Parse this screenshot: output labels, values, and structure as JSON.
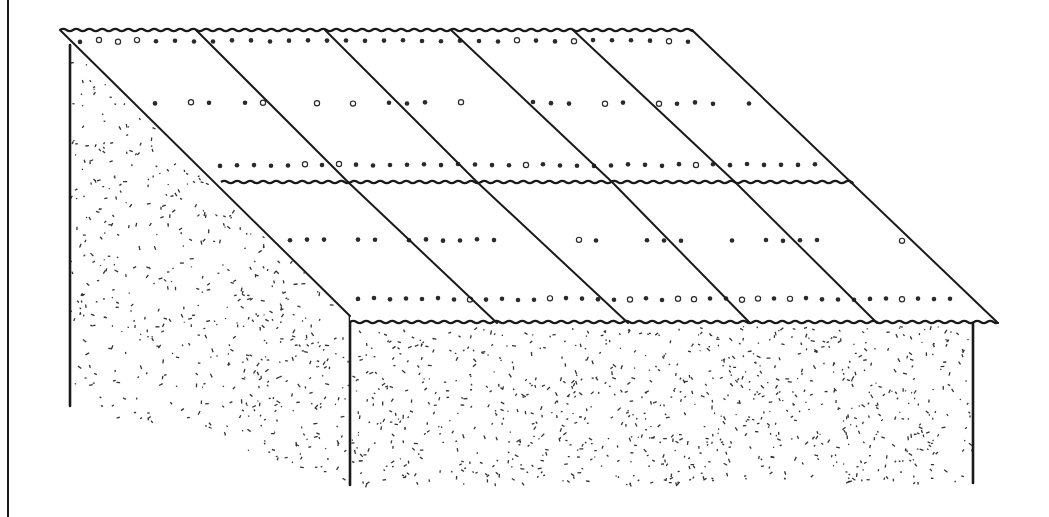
{
  "figure": {
    "colors": {
      "line": "#1a1a1a",
      "background": "#ffffff",
      "stipple": "#333333"
    },
    "frame_line": {
      "x": 8,
      "y1": 0,
      "y2": 517
    },
    "roof": {
      "ridge": {
        "x1": 60,
        "x2": 692,
        "y": 30
      },
      "left_edge": {
        "x1": 60,
        "y1": 30,
        "x2": 350,
        "y2": 316
      },
      "right_edge": {
        "x1": 692,
        "y1": 30,
        "x2": 998,
        "y2": 323
      },
      "mid_seam": {
        "x1": 221,
        "x2": 850,
        "y": 182
      },
      "eave": {
        "x1": 350,
        "x2": 998,
        "y": 322
      },
      "upper_dividers": [
        {
          "x1": 196,
          "y1": 30,
          "x2": 348,
          "y2": 182
        },
        {
          "x1": 325,
          "y1": 30,
          "x2": 477,
          "y2": 182
        },
        {
          "x1": 451,
          "y1": 30,
          "x2": 612,
          "y2": 182
        },
        {
          "x1": 573,
          "y1": 30,
          "x2": 735,
          "y2": 182
        }
      ],
      "lower_dividers": [
        {
          "x1": 348,
          "y1": 182,
          "x2": 497,
          "y2": 323
        },
        {
          "x1": 477,
          "y1": 182,
          "x2": 628,
          "y2": 323
        },
        {
          "x1": 612,
          "y1": 182,
          "x2": 750,
          "y2": 323
        },
        {
          "x1": 735,
          "y1": 182,
          "x2": 877,
          "y2": 323
        }
      ],
      "nail_rows": [
        {
          "y": 41,
          "x1": 80,
          "x2": 690,
          "step": 19
        },
        {
          "y": 103,
          "x1": 155,
          "x2": 770,
          "step": 18,
          "sparse": true
        },
        {
          "y": 165,
          "x1": 220,
          "x2": 835,
          "step": 17
        },
        {
          "y": 240,
          "x1": 290,
          "x2": 905,
          "step": 17,
          "sparse": true
        },
        {
          "y": 299,
          "x1": 358,
          "x2": 965,
          "step": 16
        }
      ],
      "sheet_count_upper": 5,
      "sheet_count_lower": 5
    },
    "side_wall": {
      "left_post": {
        "x": 70,
        "y1": 45,
        "y2": 406
      },
      "polygon": [
        [
          72,
          45
        ],
        [
          350,
          316
        ],
        [
          350,
          485
        ],
        [
          72,
          406
        ]
      ]
    },
    "front_wall": {
      "left_post": {
        "x": 350,
        "y1": 312,
        "y2": 485
      },
      "right_post": {
        "x": 973,
        "y1": 324,
        "y2": 483
      },
      "polygon": [
        [
          352,
          326
        ],
        [
          972,
          326
        ],
        [
          972,
          483
        ],
        [
          352,
          485
        ]
      ]
    },
    "stipple_density": {
      "side": 520,
      "front": 900
    }
  }
}
